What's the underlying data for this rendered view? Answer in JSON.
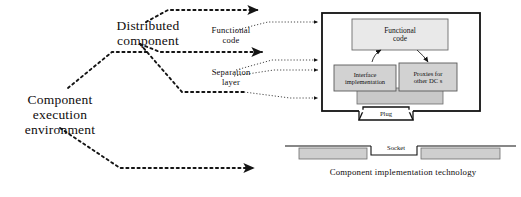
{
  "diagram": {
    "title_caption": "Component implementation technology",
    "labels": {
      "distributed_component": "Distributed\ncomponent",
      "component_execution_environment": "Component\nexecution\nenvironment",
      "functional_code_callout": "Functional\ncode",
      "separation_layer_callout": "Separation\nlayer"
    },
    "component_box": {
      "functional_code": "Functional\ncode",
      "interface_implementation": "Interface\nimplementation",
      "proxies": "Proxies for\nother DC s",
      "plug": "Plug"
    },
    "platform": {
      "socket": "Socket"
    },
    "colors": {
      "box_fill": "#e9e9e9",
      "band_fill": "#c9c9c9",
      "stroke": "#1a1a1a",
      "background": "#ffffff"
    }
  }
}
